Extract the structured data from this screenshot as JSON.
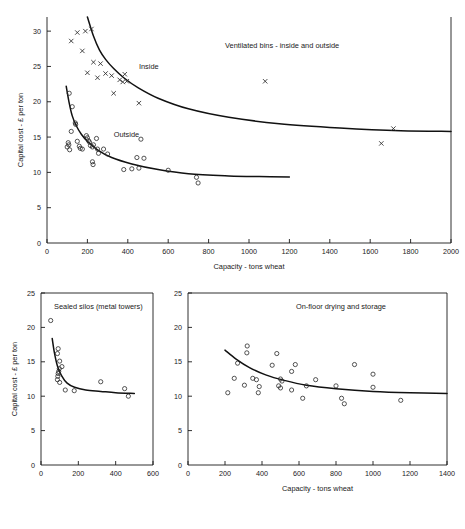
{
  "figure": {
    "background": "#ffffff",
    "ink_color": "#1a1a1a"
  },
  "chart_data": [
    {
      "type": "scatter",
      "id": "ventilated-bins",
      "title": "Ventilated bins - inside and outside",
      "xlabel": "Capacity - tons wheat",
      "ylabel": "Capital cost - £ per ton",
      "xlim": [
        0,
        2000
      ],
      "ylim": [
        0,
        32
      ],
      "xticks": [
        0,
        200,
        400,
        600,
        800,
        1000,
        1200,
        1400,
        1600,
        1800,
        2000
      ],
      "xticklabels": [
        "0",
        "200",
        "400",
        "600",
        "800",
        "1000",
        "1200",
        "1400",
        "1600",
        "1800",
        "2000"
      ],
      "yticks": [
        0,
        5,
        10,
        15,
        20,
        25,
        30
      ],
      "yticklabels": [
        "0",
        "5",
        "10",
        "15",
        "20",
        "25",
        "30"
      ],
      "grid": false,
      "legend": "inline-annotations",
      "series": [
        {
          "name": "Inside",
          "marker": "x",
          "label_position": {
            "x": 455,
            "y": 24.6
          },
          "points": [
            [
              120,
              28.6
            ],
            [
              150,
              29.8
            ],
            [
              190,
              30.0
            ],
            [
              220,
              30.3
            ],
            [
              175,
              27.2
            ],
            [
              200,
              24.1
            ],
            [
              230,
              25.6
            ],
            [
              250,
              23.4
            ],
            [
              265,
              25.4
            ],
            [
              290,
              24.0
            ],
            [
              320,
              23.7
            ],
            [
              330,
              21.2
            ],
            [
              360,
              23.1
            ],
            [
              375,
              22.8
            ],
            [
              385,
              23.9
            ],
            [
              395,
              22.9
            ],
            [
              455,
              19.8
            ],
            [
              1080,
              22.9
            ],
            [
              1655,
              14.1
            ],
            [
              1715,
              16.2
            ]
          ],
          "fit_curve": [
            [
              200,
              32.0
            ],
            [
              230,
              29.3
            ],
            [
              260,
              27.3
            ],
            [
              290,
              26.0
            ],
            [
              330,
              24.7
            ],
            [
              380,
              23.4
            ],
            [
              450,
              22.0
            ],
            [
              550,
              20.5
            ],
            [
              700,
              19.0
            ],
            [
              900,
              17.8
            ],
            [
              1150,
              16.9
            ],
            [
              1450,
              16.3
            ],
            [
              1750,
              15.9
            ],
            [
              2000,
              15.8
            ]
          ]
        },
        {
          "name": "Outside",
          "marker": "o",
          "label_position": {
            "x": 330,
            "y": 15.0
          },
          "points": [
            [
              110,
              21.2
            ],
            [
              125,
              19.3
            ],
            [
              140,
              17.0
            ],
            [
              142,
              16.8
            ],
            [
              120,
              15.8
            ],
            [
              105,
              14.2
            ],
            [
              108,
              13.9
            ],
            [
              100,
              13.6
            ],
            [
              112,
              13.2
            ],
            [
              150,
              14.4
            ],
            [
              160,
              13.7
            ],
            [
              165,
              13.4
            ],
            [
              175,
              13.3
            ],
            [
              195,
              15.2
            ],
            [
              200,
              14.9
            ],
            [
              205,
              14.5
            ],
            [
              210,
              14.3
            ],
            [
              215,
              13.8
            ],
            [
              225,
              13.6
            ],
            [
              230,
              13.9
            ],
            [
              245,
              14.8
            ],
            [
              250,
              13.3
            ],
            [
              255,
              12.7
            ],
            [
              225,
              11.5
            ],
            [
              228,
              11.1
            ],
            [
              280,
              13.3
            ],
            [
              300,
              12.6
            ],
            [
              380,
              10.4
            ],
            [
              445,
              12.1
            ],
            [
              465,
              14.7
            ],
            [
              480,
              12.0
            ],
            [
              420,
              10.5
            ],
            [
              455,
              10.6
            ],
            [
              600,
              10.3
            ],
            [
              740,
              9.3
            ],
            [
              748,
              8.5
            ]
          ],
          "fit_curve": [
            [
              95,
              22.2
            ],
            [
              110,
              19.8
            ],
            [
              125,
              18.0
            ],
            [
              145,
              16.6
            ],
            [
              170,
              15.4
            ],
            [
              200,
              14.4
            ],
            [
              250,
              13.2
            ],
            [
              320,
              12.1
            ],
            [
              420,
              11.2
            ],
            [
              550,
              10.4
            ],
            [
              700,
              9.8
            ],
            [
              900,
              9.5
            ],
            [
              1050,
              9.4
            ],
            [
              1200,
              9.35
            ]
          ]
        }
      ]
    },
    {
      "type": "scatter",
      "id": "sealed-silos",
      "title": "Sealed silos (metal towers)",
      "xlabel": "",
      "ylabel": "Capital cost - £ per ton",
      "xlim": [
        0,
        600
      ],
      "ylim": [
        0,
        25
      ],
      "xticks": [
        0,
        200,
        400,
        600
      ],
      "xticklabels": [
        "0",
        "200",
        "400",
        "600"
      ],
      "yticks": [
        0,
        5,
        10,
        15,
        20,
        25
      ],
      "yticklabels": [
        "0",
        "5",
        "10",
        "15",
        "20",
        "25"
      ],
      "grid": false,
      "series": [
        {
          "name": "Sealed silos",
          "marker": "o",
          "points": [
            [
              52,
              21.0
            ],
            [
              92,
              16.9
            ],
            [
              88,
              16.2
            ],
            [
              100,
              15.1
            ],
            [
              112,
              14.3
            ],
            [
              98,
              14.0
            ],
            [
              95,
              13.6
            ],
            [
              92,
              13.3
            ],
            [
              90,
              12.9
            ],
            [
              88,
              12.4
            ],
            [
              100,
              12.0
            ],
            [
              130,
              10.9
            ],
            [
              178,
              10.8
            ],
            [
              320,
              12.1
            ],
            [
              448,
              11.1
            ],
            [
              468,
              10.0
            ]
          ],
          "fit_curve": [
            [
              60,
              18.4
            ],
            [
              72,
              16.3
            ],
            [
              88,
              14.4
            ],
            [
              110,
              13.0
            ],
            [
              140,
              11.9
            ],
            [
              180,
              11.3
            ],
            [
              240,
              10.9
            ],
            [
              320,
              10.7
            ],
            [
              400,
              10.5
            ],
            [
              500,
              10.4
            ]
          ]
        }
      ]
    },
    {
      "type": "scatter",
      "id": "on-floor-drying",
      "title": "On-floor drying and storage",
      "xlabel": "Capacity - tons wheat",
      "ylabel": "",
      "xlim": [
        0,
        1400
      ],
      "ylim": [
        0,
        25
      ],
      "xticks": [
        0,
        200,
        400,
        600,
        800,
        1000,
        1200,
        1400
      ],
      "xticklabels": [
        "0",
        "200",
        "400",
        "600",
        "800",
        "1000",
        "1200",
        "1400"
      ],
      "yticks": [
        0,
        5,
        10,
        15,
        20,
        25
      ],
      "yticklabels": [
        "0",
        "5",
        "10",
        "15",
        "20",
        "25"
      ],
      "grid": false,
      "series": [
        {
          "name": "On-floor drying and storage",
          "marker": "o",
          "points": [
            [
              320,
              17.3
            ],
            [
              318,
              16.3
            ],
            [
              480,
              16.2
            ],
            [
              268,
              14.8
            ],
            [
              455,
              14.5
            ],
            [
              580,
              14.6
            ],
            [
              900,
              14.6
            ],
            [
              560,
              13.6
            ],
            [
              250,
              12.6
            ],
            [
              350,
              12.6
            ],
            [
              370,
              12.4
            ],
            [
              500,
              12.5
            ],
            [
              508,
              12.2
            ],
            [
              690,
              12.4
            ],
            [
              1000,
              13.2
            ],
            [
              305,
              11.6
            ],
            [
              385,
              11.4
            ],
            [
              490,
              11.5
            ],
            [
              500,
              11.2
            ],
            [
              640,
              11.5
            ],
            [
              560,
              10.9
            ],
            [
              800,
              11.5
            ],
            [
              1000,
              11.3
            ],
            [
              215,
              10.5
            ],
            [
              380,
              10.5
            ],
            [
              620,
              9.7
            ],
            [
              830,
              9.7
            ],
            [
              845,
              8.9
            ],
            [
              1150,
              9.4
            ]
          ],
          "fit_curve": [
            [
              200,
              16.7
            ],
            [
              260,
              15.4
            ],
            [
              330,
              14.2
            ],
            [
              420,
              13.1
            ],
            [
              520,
              12.3
            ],
            [
              640,
              11.6
            ],
            [
              800,
              11.1
            ],
            [
              1000,
              10.7
            ],
            [
              1200,
              10.5
            ],
            [
              1400,
              10.4
            ]
          ]
        }
      ]
    }
  ]
}
